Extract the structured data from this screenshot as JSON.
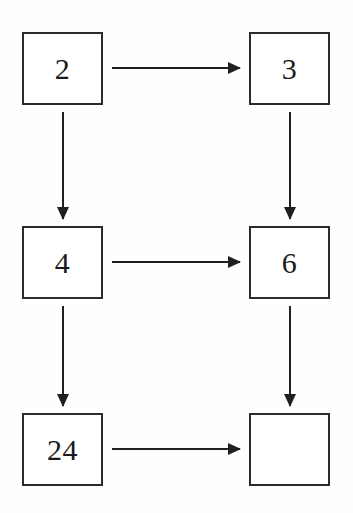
{
  "diagram": {
    "type": "flow-grid",
    "background_color": "#fefefe",
    "box_border_color": "#2b2b2b",
    "arrow_color": "#1f1f1f",
    "text_color": "#1a1a1a",
    "grid": {
      "columns": 2,
      "rows": 3
    },
    "nodes": [
      {
        "id": "n1",
        "label": "2",
        "row": "top",
        "column": "left",
        "empty": false
      },
      {
        "id": "n2",
        "label": "3",
        "row": "top",
        "column": "right",
        "empty": false
      },
      {
        "id": "n3",
        "label": "4",
        "row": "middle",
        "column": "left",
        "empty": false
      },
      {
        "id": "n4",
        "label": "6",
        "row": "middle",
        "column": "right",
        "empty": false
      },
      {
        "id": "n5",
        "label": "24",
        "row": "bottom",
        "column": "left",
        "empty": false
      },
      {
        "id": "n6",
        "label": "",
        "row": "bottom",
        "column": "right",
        "empty": true
      }
    ],
    "edges": [
      {
        "id": "e1",
        "from": "n1",
        "to": "n2",
        "direction": "right"
      },
      {
        "id": "e2",
        "from": "n3",
        "to": "n4",
        "direction": "right"
      },
      {
        "id": "e3",
        "from": "n5",
        "to": "n6",
        "direction": "right"
      },
      {
        "id": "e4",
        "from": "n1",
        "to": "n3",
        "direction": "down"
      },
      {
        "id": "e5",
        "from": "n3",
        "to": "n5",
        "direction": "down"
      },
      {
        "id": "e6",
        "from": "n2",
        "to": "n4",
        "direction": "down"
      },
      {
        "id": "e7",
        "from": "n4",
        "to": "n6",
        "direction": "down"
      }
    ]
  },
  "chart_data": {
    "type": "diagram",
    "categories": [
      "top-left",
      "top-right",
      "middle-left",
      "middle-right",
      "bottom-left",
      "bottom-right"
    ],
    "values": [
      "2",
      "3",
      "4",
      "6",
      "24",
      ""
    ],
    "legend": [],
    "xlabel": "",
    "ylabel": ""
  }
}
